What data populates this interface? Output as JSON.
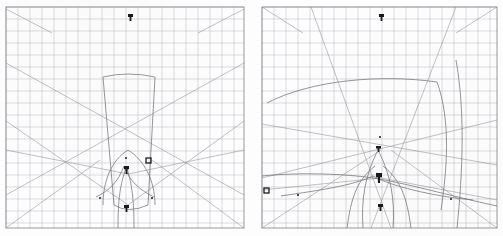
{
  "figure": {
    "title_fragment": "",
    "background_color": "#fdfdfd",
    "grid_color": "#b9b7bd",
    "grid_border_color": "#8e8c93",
    "ray_color": "#8a8790",
    "caustic_color": "#6e6b74",
    "marker_color": "#1b1b1b",
    "panel_count": 2
  },
  "panels": [
    {
      "id": "panel-left",
      "name": "left-ray-diagram",
      "label": "",
      "grid": {
        "x": 6,
        "y": 7,
        "width": 238,
        "height": 221,
        "cell_size": 12,
        "cols": 20,
        "rows": 18,
        "show_border": true
      },
      "markers": [
        {
          "name": "upper-blob",
          "x": 128,
          "y": 14,
          "w": 5,
          "h": 7,
          "shape": "blob"
        },
        {
          "name": "center-blob",
          "x": 124,
          "y": 166,
          "w": 5,
          "h": 8,
          "shape": "blob"
        },
        {
          "name": "lower-blob",
          "x": 124,
          "y": 205,
          "w": 5,
          "h": 7,
          "shape": "blob"
        },
        {
          "name": "right-square",
          "x": 146,
          "y": 158,
          "w": 5,
          "h": 5,
          "shape": "square"
        },
        {
          "name": "dot-upper-center",
          "x": 125,
          "y": 157,
          "w": 2,
          "h": 2,
          "shape": "dot"
        },
        {
          "name": "dot-left",
          "x": 99,
          "y": 197,
          "w": 2,
          "h": 2,
          "shape": "dot"
        },
        {
          "name": "dot-right",
          "x": 151,
          "y": 197,
          "w": 2,
          "h": 2,
          "shape": "dot"
        }
      ],
      "rays": [
        "M6,63 L244,195",
        "M244,63 L6,195",
        "M6,121 L128,205",
        "M244,121 L128,205",
        "M6,150 L128,174",
        "M244,150 L128,174",
        "M6,9 L52,33",
        "M244,9 L198,33",
        "M6,228 L100,160",
        "M244,228 L152,160"
      ],
      "caustics": [
        "M103,77 Q128,71 155,77 L148,205 Q128,214 114,205 Z",
        "M103,205 C103,180 112,160 128,150 C144,160 155,180 155,205",
        "M96,197 C110,190 118,182 124,166 C130,182 140,190 154,197",
        "M118,228 C118,200 120,185 126,168",
        "M134,228 C134,200 132,185 127,168"
      ]
    },
    {
      "id": "panel-right",
      "name": "right-ray-diagram",
      "label": "",
      "grid": {
        "x": 11,
        "y": 7,
        "width": 235,
        "height": 221,
        "cell_size": 12,
        "cols": 19,
        "rows": 18,
        "show_border": true
      },
      "markers": [
        {
          "name": "upper-blob",
          "x": 128,
          "y": 14,
          "w": 5,
          "h": 7,
          "shape": "blob"
        },
        {
          "name": "upper-center-square",
          "x": 125,
          "y": 146,
          "w": 5,
          "h": 6,
          "shape": "blob"
        },
        {
          "name": "center-blob",
          "x": 125,
          "y": 173,
          "w": 6,
          "h": 10,
          "shape": "blob"
        },
        {
          "name": "lower-blob",
          "x": 127,
          "y": 204,
          "w": 5,
          "h": 7,
          "shape": "blob"
        },
        {
          "name": "left-square",
          "x": 13,
          "y": 188,
          "w": 5,
          "h": 5,
          "shape": "square"
        },
        {
          "name": "dot-top",
          "x": 128,
          "y": 136,
          "w": 2,
          "h": 2,
          "shape": "dot"
        },
        {
          "name": "dot-left-mid",
          "x": 46,
          "y": 194,
          "w": 2,
          "h": 2,
          "shape": "dot"
        },
        {
          "name": "dot-right-mid",
          "x": 199,
          "y": 198,
          "w": 2,
          "h": 2,
          "shape": "dot"
        }
      ],
      "rays": [
        "M11,7 L52,33",
        "M246,7 L205,33",
        "M11,124 L246,165",
        "M11,178 L246,120",
        "M11,190 L130,178",
        "M246,200 L130,178",
        "M11,228 L130,150",
        "M246,228 L140,150",
        "M60,7 L140,228",
        "M205,7 L120,228"
      ],
      "caustics": [
        "M16,103 C60,80 130,74 186,82 C200,120 196,170 190,210",
        "M11,176 C50,172 96,174 122,178 C150,182 200,196 246,206",
        "M30,196 C70,190 100,186 122,176 C140,186 180,196 222,200",
        "M112,228 C110,200 114,176 126,152",
        "M142,228 C144,200 140,176 128,152",
        "M96,228 C100,198 106,180 124,166",
        "M160,228 C156,198 150,180 132,166",
        "M205,60 C214,110 212,170 206,228"
      ]
    }
  ]
}
